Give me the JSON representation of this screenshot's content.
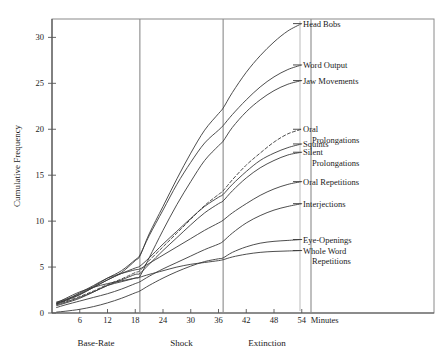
{
  "chart_data": {
    "type": "line",
    "title": "",
    "subtitle": "",
    "xlabel": "Minutes",
    "ylabel": "Cumulative Frequency",
    "xlim": [
      0,
      57
    ],
    "ylim": [
      0,
      32
    ],
    "xticks": [
      6,
      12,
      18,
      24,
      30,
      36,
      42,
      48,
      54
    ],
    "xtick_labels": [
      "6",
      "12",
      "18",
      "24",
      "30",
      "36",
      "42",
      "48",
      "54"
    ],
    "yticks": [
      0,
      5,
      10,
      15,
      20,
      25,
      30
    ],
    "ytick_labels": [
      "0",
      "5",
      "10",
      "15",
      "20",
      "25",
      "30"
    ],
    "grid": false,
    "legend_position": "right-inline-labels",
    "x_axis_unit_label": "Minutes",
    "phases": [
      {
        "name": "Base-Rate",
        "start": 0,
        "end": 19,
        "center": 9.5
      },
      {
        "name": "Shock",
        "start": 19,
        "end": 37,
        "center": 28
      },
      {
        "name": "Extinction",
        "start": 37,
        "end": 56,
        "center": 46.5
      }
    ],
    "phase_dividers": [
      19,
      37,
      56
    ],
    "series": [
      {
        "name": "Head Bobs",
        "style": "solid",
        "x": [
          1,
          3,
          6,
          9,
          12,
          15,
          18,
          19,
          21,
          24,
          27,
          30,
          33,
          36,
          37,
          39,
          42,
          45,
          48,
          51,
          54
        ],
        "values": [
          1.1,
          1.4,
          2.0,
          2.8,
          3.6,
          4.4,
          5.7,
          6.2,
          8.6,
          11.6,
          14.6,
          17.4,
          19.9,
          21.7,
          22.3,
          24.0,
          26.2,
          28.0,
          29.5,
          30.7,
          31.5
        ]
      },
      {
        "name": "Word Output",
        "style": "solid",
        "x": [
          1,
          3,
          6,
          9,
          12,
          15,
          18,
          19,
          21,
          24,
          27,
          30,
          33,
          36,
          37,
          39,
          42,
          45,
          48,
          51,
          54
        ],
        "values": [
          1.2,
          1.5,
          2.1,
          2.9,
          3.8,
          4.6,
          5.8,
          6.3,
          8.4,
          11.2,
          14.0,
          16.4,
          18.5,
          19.9,
          20.4,
          21.6,
          23.2,
          24.6,
          25.7,
          26.5,
          27.0
        ]
      },
      {
        "name": "Jaw Movements",
        "style": "solid",
        "x": [
          1,
          3,
          6,
          9,
          12,
          15,
          18,
          19,
          21,
          24,
          27,
          30,
          33,
          36,
          37,
          39,
          42,
          45,
          48,
          51,
          54
        ],
        "values": [
          0.9,
          1.2,
          1.7,
          2.3,
          3.0,
          3.4,
          3.8,
          4.0,
          6.0,
          9.0,
          11.8,
          14.3,
          16.6,
          18.2,
          18.7,
          20.2,
          21.9,
          23.2,
          24.2,
          24.9,
          25.3
        ]
      },
      {
        "name": "Oral Prolongations",
        "style": "dashed",
        "x": [
          1,
          3,
          6,
          9,
          12,
          15,
          18,
          19,
          21,
          24,
          27,
          30,
          33,
          36,
          37,
          39,
          42,
          45,
          48,
          51,
          54
        ],
        "values": [
          1.0,
          1.3,
          1.8,
          2.4,
          3.1,
          3.7,
          4.4,
          4.6,
          5.7,
          7.2,
          8.7,
          10.2,
          11.7,
          12.9,
          13.3,
          14.5,
          16.1,
          17.4,
          18.6,
          19.5,
          20.0
        ]
      },
      {
        "name": "Squints",
        "style": "solid",
        "x": [
          1,
          3,
          6,
          9,
          12,
          15,
          18,
          19,
          21,
          24,
          27,
          30,
          33,
          36,
          37,
          39,
          42,
          45,
          48,
          51,
          54
        ],
        "values": [
          1.0,
          1.4,
          2.0,
          2.8,
          3.6,
          4.3,
          4.9,
          5.1,
          6.0,
          7.5,
          8.9,
          10.3,
          11.6,
          12.6,
          12.9,
          14.0,
          15.4,
          16.6,
          17.4,
          18.0,
          18.4
        ]
      },
      {
        "name": "Silent Prolongations",
        "style": "solid",
        "x": [
          1,
          3,
          6,
          9,
          12,
          15,
          18,
          19,
          21,
          24,
          27,
          30,
          33,
          36,
          37,
          39,
          42,
          45,
          48,
          51,
          54
        ],
        "values": [
          0.8,
          1.1,
          1.6,
          2.3,
          3.0,
          3.6,
          4.2,
          4.3,
          5.3,
          6.8,
          8.2,
          9.6,
          10.9,
          11.9,
          12.2,
          13.3,
          14.7,
          15.8,
          16.6,
          17.2,
          17.5
        ]
      },
      {
        "name": "Oral Repetitions",
        "style": "solid",
        "x": [
          1,
          3,
          6,
          9,
          12,
          15,
          18,
          19,
          21,
          24,
          27,
          30,
          33,
          36,
          37,
          39,
          42,
          45,
          48,
          51,
          54
        ],
        "values": [
          1.0,
          1.4,
          2.2,
          3.0,
          3.8,
          4.3,
          4.7,
          4.8,
          5.4,
          6.3,
          7.2,
          8.1,
          9.0,
          9.8,
          10.1,
          10.9,
          11.9,
          12.8,
          13.5,
          14.0,
          14.3
        ]
      },
      {
        "name": "Interjections",
        "style": "solid",
        "x": [
          1,
          3,
          6,
          9,
          12,
          15,
          18,
          19,
          21,
          24,
          27,
          30,
          33,
          36,
          37,
          39,
          42,
          45,
          48,
          51,
          54
        ],
        "values": [
          0.6,
          0.9,
          1.3,
          1.7,
          2.1,
          2.6,
          3.2,
          3.4,
          4.0,
          4.8,
          5.5,
          6.2,
          6.9,
          7.5,
          7.8,
          8.7,
          9.8,
          10.6,
          11.2,
          11.6,
          11.9
        ]
      },
      {
        "name": "Eye-Openings",
        "style": "solid",
        "x": [
          1,
          3,
          6,
          9,
          12,
          15,
          18,
          19,
          21,
          24,
          27,
          30,
          33,
          36,
          37,
          39,
          42,
          45,
          48,
          51,
          54
        ],
        "values": [
          0.1,
          0.2,
          0.4,
          0.7,
          1.1,
          1.6,
          2.2,
          2.4,
          3.0,
          3.8,
          4.5,
          5.1,
          5.6,
          5.9,
          6.0,
          6.6,
          7.2,
          7.6,
          7.8,
          7.9,
          8.0
        ]
      },
      {
        "name": "Whole Word Repetitions",
        "style": "solid",
        "x": [
          1,
          3,
          6,
          9,
          12,
          15,
          18,
          19,
          21,
          24,
          27,
          30,
          33,
          36,
          37,
          39,
          42,
          45,
          48,
          51,
          54
        ],
        "values": [
          1.1,
          1.6,
          2.3,
          2.8,
          3.2,
          3.5,
          3.8,
          3.9,
          4.2,
          4.6,
          5.0,
          5.3,
          5.5,
          5.7,
          5.8,
          6.1,
          6.4,
          6.6,
          6.7,
          6.75,
          6.8
        ]
      }
    ],
    "series_labels": [
      {
        "lines": [
          "Head Bobs"
        ],
        "y_value": 31.5
      },
      {
        "lines": [
          "Word Output"
        ],
        "y_value": 27.0
      },
      {
        "lines": [
          "Jaw Movements"
        ],
        "y_value": 25.3
      },
      {
        "lines": [
          "Oral",
          "Prolongations"
        ],
        "y_value": 20.0
      },
      {
        "lines": [
          "Squints"
        ],
        "y_value": 18.4
      },
      {
        "lines": [
          "Silent",
          "Prolongations"
        ],
        "y_value": 17.5
      },
      {
        "lines": [
          "Oral Repetitions"
        ],
        "y_value": 14.3
      },
      {
        "lines": [
          "Interjections"
        ],
        "y_value": 11.9
      },
      {
        "lines": [
          "Eye-Openings"
        ],
        "y_value": 8.0
      },
      {
        "lines": [
          "Whole Word",
          "Repetitions"
        ],
        "y_value": 6.8
      }
    ]
  },
  "colors": {
    "background": "#ffffff",
    "curve": "#3a3a3a",
    "axis": "#555555",
    "frame": "#8a8a8a",
    "text": "#1a1a1a"
  }
}
